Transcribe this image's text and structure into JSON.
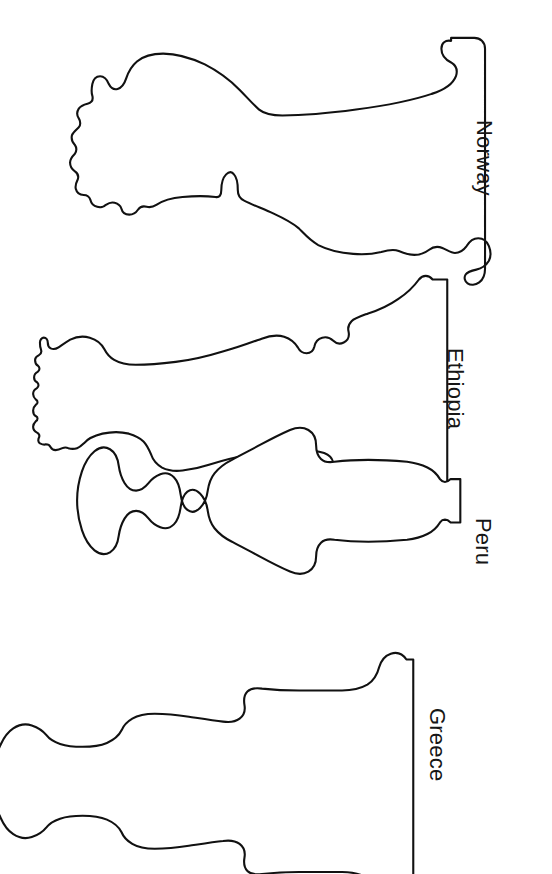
{
  "page": {
    "background_color": "#ffffff",
    "outline_color": "#111111",
    "text_color": "#161616",
    "width": 552,
    "height": 874
  },
  "vases": [
    {
      "label": "Norway",
      "icon": "vase-outline-icon",
      "label_left": 497,
      "label_top": 120,
      "svg": {
        "left": 40,
        "top": 33,
        "width": 446,
        "height": 216
      },
      "path": "M 446,12 C 444,7 441,4 436,4 C 430,4 426,7 425,12 C 423,22 426,31 432,37 C 437,42 438,49 435,55 C 431,62 423,66 414,68 C 398,72 372,77 345,81 C 318,85 290,88 271,90 C 252,92 240,92 233,90 C 226,88 222,85 219,81 C 215,76 210,70 204,64 C 197,57 189,50 181,44 C 170,36 158,30 145,26 C 132,22 120,21 110,22 C 100,23 93,26 88,30 C 83,34 80,39 78,44 C 76,50 74,55 71,58 C 68,61 64,62 60,61 C 57,60 55,58 54,55 C 53,51 52,48 50,46 C 48,44 45,43 42,44 C 39,45 37,47 36,50 C 35,53 35,57 36,60 C 37,63 37,66 36,69 C 34,72 31,73 28,73 C 24,73 21,74 19,76 C 17,78 16,81 16,84 C 16,87 17,90 19,92 C 21,94 22,97 21,100 C 20,103 18,105 15,106 C 12,107 10,109 9,112 C 8,115 8,118 10,121 C 12,124 13,127 12,130 C 11,133 9,135 7,137 C 5,139 4,142 4,145 C 4,148 6,151 8,153 C 10,155 11,158 10,161 C 9,164 7,166 6,169 C 5,172 5,175 7,178 C 9,181 11,183 13,185 C 15,187 16,190 15,193 C 14,196 13,199 14,202 C 15,205 17,207 20,208 C 23,209 25,211 26,214 C 27,217 27,220 29,223 C 31,226 34,228 37,228 C 40,228 43,227 45,225 C 47,223 50,222 53,223 C 56,224 58,226 59,229 C 60,232 62,234 65,235 C 68,236 71,236 74,234 C 77,232 79,230 82,229 C 85,228 88,229 90,231 C 93,234 96,236 99,236 C 102,236 105,235 107,233 C 110,230 113,229 116,230 C 119,231 122,231 125,230 C 128,229 130,227 132,226 C 137,223 144,221 152,220 C 162,219 173,219 182,220 C 192,221 198,222 202,223 C 205,224 206,221 206,216 C 206,210 207,204 209,199 C 211,195 214,192 217,193 C 220,194 222,198 223,204 C 224,210 224,216 224,220 C 224,224 226,227 230,229 C 236,232 244,235 253,238 C 263,241 272,244 279,248 C 284,251 288,255 291,259 C 295,264 299,269 306,273 C 313,277 322,279 332,280 C 341,281 349,280 355,279 C 362,278 366,276 370,275 C 374,274 378,274 381,276 C 385,278 388,280 392,281 C 396,282 400,281 403,279 C 407,277 410,275 414,275 C 418,275 421,277 424,280 C 427,283 431,285 435,285 C 439,285 442,283 444,280 C 447,276 450,273 454,272 C 458,271 462,272 465,275 C 469,278 471,282 472,287 C 473,292 472,297 470,301 C 468,305 465,308 461,310 C 457,312 453,313 450,313 C 446,313 443,314 441,317 C 439,320 439,323 441,326 C 443,329 446,331 450,331 C 455,331 459,329 462,326 C 465,322 467,318 467,313 L 467,12 C 467,7 463,4 457,4 C 451,4 447,7 446,12 Z"
    },
    {
      "label": "Ethiopia",
      "icon": "vase-outline-icon",
      "label_left": 468,
      "label_top": 348,
      "svg": {
        "left": 35,
        "top": 262,
        "width": 420,
        "height": 190
      },
      "path": "M 410,8 C 408,4 405,2 401,2 C 397,2 394,4 392,8 C 389,14 385,20 379,26 C 371,34 360,42 348,48 C 336,54 325,58 316,61 C 308,64 303,66 300,69 C 297,72 296,76 296,80 C 296,85 294,89 291,91 C 288,93 284,93 281,91 C 278,89 275,88 271,89 C 267,90 265,93 264,97 C 263,101 261,104 258,105 C 255,106 252,105 250,102 C 247,98 243,95 238,93 C 232,91 225,91 218,93 C 209,96 198,100 186,104 C 172,109 156,113 140,116 C 124,119 110,121 99,122 C 88,123 81,123 76,121 C 71,119 68,116 66,112 C 63,107 59,103 53,100 C 46,97 38,96 31,97 C 25,98 21,100 18,102 C 15,104 13,106 11,107 C 8,109 5,109 3,108 C 1,107 0,105 0,103 C 0,100 -1,98 -3,97 C -5,96 -7,97 -8,99 C -9,101 -9,103 -8,105 C -7,107 -7,109 -8,111 C -9,113 -11,114 -13,114 C -15,114 -17,115 -18,117 C -19,119 -19,121 -18,123 C -17,125 -17,127 -18,129 C -19,131 -21,132 -23,132 C -25,132 -27,133 -28,135 C -29,137 -29,139 -28,141 C -27,143 -27,145 -28,147 C -29,149 -31,150 -33,151 C -35,152 -36,154 -36,156 C -36,158 -35,160 -33,161 C -31,162 -30,164 -30,166 C -30,168 -31,170 -33,171 C -35,172 -36,174 -36,176 C -36,178 -35,180 -33,181 C -31,182 -30,184 -30,186 C -30,188 -31,190 -32,192 C -33,194 -33,196 -32,198 C -31,200 -29,201 -27,201 C -25,201 -23,202 -22,204 C -21,206 -21,208 -22,210 C -23,212 -22,215 -20,216 C -18,217 -16,217 -14,216 C -12,215 -10,215 -8,216 C -6,217 -5,219 -5,221 C -5,223 -4,225 -2,226 C 0,227 2,227 4,226 C 6,225 8,225 10,226 C 12,227 14,228 16,228 C 19,228 21,227 23,226 C 25,224 28,224 30,225 C 33,226 36,226 39,225 C 42,224 44,222 46,220 C 50,216 56,213 63,211 C 71,209 80,209 88,210 C 95,211 100,213 104,215 C 108,217 110,220 111,224 C 112,229 114,233 118,237 C 123,242 130,245 138,246 C 146,247 154,246 161,244 C 173,241 187,237 203,234 C 219,231 235,229 249,228 C 262,227 272,227 279,228 C 285,229 288,231 290,234 C 292,237 292,241 291,245 C 290,249 290,253 292,256 C 294,259 297,260 301,259 C 305,258 308,256 310,253 C 312,250 315,248 319,248 C 323,248 326,250 329,253 C 333,257 338,260 345,263 C 353,266 362,269 370,272 C 378,275 384,278 388,281 C 392,284 395,288 397,292 C 399,296 402,299 406,299 C 410,299 413,296 414,292 L 414,8 C 414,4 412,2 410,2 Z"
    },
    {
      "label": "Peru",
      "icon": "vase-outline-icon",
      "label_left": 496,
      "label_top": 518,
      "svg": {
        "left": 168,
        "top": 480,
        "width": 300,
        "height": 156
      },
      "path": "M 296,6 C 294,2 291,0 287,0 C 283,0 280,2 279,6 C 277,13 273,19 267,24 C 261,29 254,32 247,34 C 238,36 226,38 213,39 C 200,40 188,40 179,39 C 171,38 166,37 162,36 C 157,35 153,36 150,39 C 147,42 145,46 144,51 C 143,57 140,62 135,65 C 130,68 124,69 118,68 C 110,67 101,64 91,60 C 80,56 69,51 59,46 C 50,42 43,38 38,34 C 33,30 30,25 28,20 C 26,14 22,9 17,6 C 12,3 7,3 3,6 C -1,9 -3,14 -4,20 C -5,27 -7,33 -11,37 C -15,41 -20,43 -25,42 C -31,41 -36,38 -40,34 C -44,30 -48,27 -53,26 C -58,25 -62,27 -65,31 C -68,35 -70,40 -71,46 C -72,53 -75,58 -80,61 C -85,64 -91,64 -96,61 C -101,58 -105,53 -107,47 C -110,39 -112,30 -113,21 C -114,12 -114,4 -113,-3 C -112,-11 -110,-18 -107,-23 C -104,-28 -100,-31 -96,-31 C -91,-31 -87,-28 -84,-23 C -81,-18 -79,-12 -78,-5 C -77,1 -75,6 -71,9 C -67,12 -63,12 -59,10 C -55,8 -52,5 -50,1 C -48,-4 -45,-7 -41,-8 C -37,-9 -33,-8 -30,-5 C -26,-1 -22,2 -17,3 C -12,4 -8,3 -5,0 C -2,-4 0,-9 1,-15 C 2,-22 5,-27 10,-30 C 15,-33 21,-33 26,-30 C 31,-27 35,-22 38,-16 C 41,-10 45,-5 51,-1 C 58,4 68,8 79,12 C 91,16 103,20 114,23 C 124,26 132,28 138,29 C 143,30 147,29 150,26 C 153,23 155,19 156,14 C 157,8 160,3 165,0 C 170,-3 176,-3 182,0 C 187,2 191,6 193,11 C 196,17 200,21 206,24 C 213,27 222,29 232,30 C 242,31 251,31 258,30 C 264,29 269,28 273,26 C 278,24 281,21 283,17 C 285,12 288,8 292,6 C 296,4 300,4 303,7 C 306,10 308,14 308,19 L 308,6 C 308,2 304,0 300,0 C 298,0 296,2 296,6 Z"
    },
    {
      "label": "Greece",
      "icon": "vase-outline-icon",
      "label_left": 450,
      "label_top": 708,
      "svg": {
        "left": 22,
        "top": 640,
        "width": 400,
        "height": 200
      },
      "path": "M 389,8 C 387,3 383,0 378,0 C 373,0 369,3 367,8 C 364,16 360,23 353,28 C 346,33 338,36 329,37 C 318,38 304,38 289,38 C 274,38 261,37 252,36 C 244,35 239,34 235,33 C 231,32 228,33 226,36 C 224,39 223,43 223,48 C 223,54 221,59 217,62 C 213,65 207,66 201,65 C 192,64 181,62 169,60 C 157,58 146,57 136,57 C 127,57 120,58 115,60 C 110,62 106,65 104,69 C 101,74 97,78 91,81 C 84,84 75,86 66,86 C 57,86 49,85 43,83 C 37,81 33,78 30,75 C 26,71 22,68 17,66 C 11,64 5,64 0,66 C -5,68 -9,72 -12,77 C -15,83 -19,88 -25,91 C -31,94 -38,94 -44,92 C -50,90 -55,86 -58,81 C -62,75 -67,71 -73,69 C -80,67 -87,68 -93,72 C -99,76 -103,82 -105,90 C -107,98 -108,107 -108,116 C -108,125 -107,134 -105,142 C -103,150 -99,156 -93,160 C -87,164 -80,165 -73,163 C -67,161 -62,157 -58,151 C -55,146 -50,142 -44,140 C -38,138 -31,138 -25,141 C -19,144 -15,149 -12,155 C -9,160 -5,164 0,166 C 5,168 11,168 17,166 C 22,164 26,161 30,157 C 33,154 37,151 43,149 C 49,147 57,146 66,146 C 75,146 84,148 91,151 C 97,154 101,158 104,163 C 106,167 110,170 115,172 C 120,174 127,175 136,175 C 146,175 157,174 169,172 C 181,170 192,168 201,167 C 207,166 213,167 217,170 C 221,173 223,178 223,184 C 223,189 224,193 226,196 C 228,199 231,200 235,199 C 239,198 244,197 252,196 C 261,195 274,194 289,194 C 304,194 318,194 329,195 C 338,196 346,199 353,204 C 360,209 364,216 367,224 C 369,229 373,232 378,232 C 383,232 387,229 389,224 L 389,8 Z"
    }
  ]
}
